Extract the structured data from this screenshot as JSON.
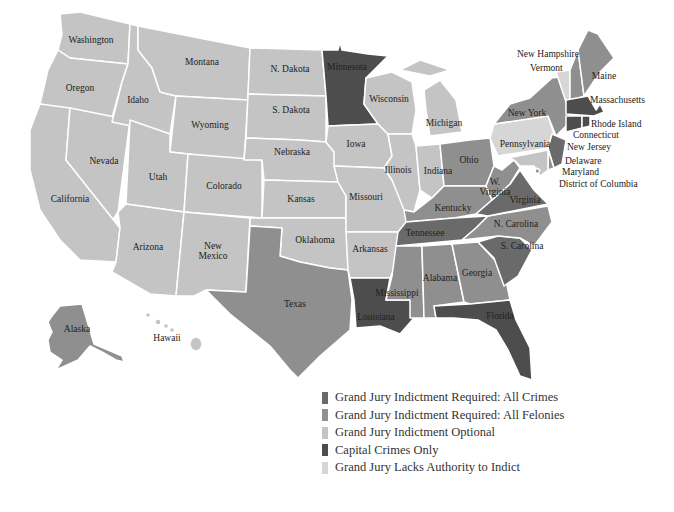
{
  "colors": {
    "all_crimes": "#6a6a6a",
    "all_felonies": "#8f8f8f",
    "optional": "#c4c4c4",
    "capital_only": "#4d4d4d",
    "lacks_authority": "#d6d6d6"
  },
  "legend": {
    "items": [
      {
        "label": "Grand Jury Indictment Required: All Crimes",
        "key": "all_crimes"
      },
      {
        "label": "Grand Jury Indictment Required: All Felonies",
        "key": "all_felonies"
      },
      {
        "label": "Grand Jury Indictment Optional",
        "key": "optional"
      },
      {
        "label": "Capital Crimes Only",
        "key": "capital_only"
      },
      {
        "label": "Grand Jury Lacks Authority to Indict",
        "key": "lacks_authority"
      }
    ]
  },
  "states": {
    "washington": {
      "label": "Washington",
      "category": "optional"
    },
    "oregon": {
      "label": "Oregon",
      "category": "optional"
    },
    "california": {
      "label": "California",
      "category": "optional"
    },
    "nevada": {
      "label": "Nevada",
      "category": "optional"
    },
    "idaho": {
      "label": "Idaho",
      "category": "optional"
    },
    "montana": {
      "label": "Montana",
      "category": "optional"
    },
    "wyoming": {
      "label": "Wyoming",
      "category": "optional"
    },
    "utah": {
      "label": "Utah",
      "category": "optional"
    },
    "colorado": {
      "label": "Colorado",
      "category": "optional"
    },
    "arizona": {
      "label": "Arizona",
      "category": "optional"
    },
    "new_mexico": {
      "label": "New\nMexico",
      "category": "optional"
    },
    "n_dakota": {
      "label": "N. Dakota",
      "category": "optional"
    },
    "s_dakota": {
      "label": "S. Dakota",
      "category": "optional"
    },
    "nebraska": {
      "label": "Nebraska",
      "category": "optional"
    },
    "kansas": {
      "label": "Kansas",
      "category": "optional"
    },
    "oklahoma": {
      "label": "Oklahoma",
      "category": "optional"
    },
    "texas": {
      "label": "Texas",
      "category": "all_felonies"
    },
    "minnesota": {
      "label": "Minnesota",
      "category": "capital_only"
    },
    "iowa": {
      "label": "Iowa",
      "category": "optional"
    },
    "missouri": {
      "label": "Missouri",
      "category": "optional"
    },
    "arkansas": {
      "label": "Arkansas",
      "category": "optional"
    },
    "louisiana": {
      "label": "Louisiana",
      "category": "capital_only"
    },
    "wisconsin": {
      "label": "Wisconsin",
      "category": "optional"
    },
    "illinois": {
      "label": "Illinois",
      "category": "optional"
    },
    "michigan": {
      "label": "Michigan",
      "category": "optional"
    },
    "indiana": {
      "label": "Indiana",
      "category": "optional"
    },
    "ohio": {
      "label": "Ohio",
      "category": "all_felonies"
    },
    "kentucky": {
      "label": "Kentucky",
      "category": "all_felonies"
    },
    "tennessee": {
      "label": "Tennessee",
      "category": "all_crimes"
    },
    "mississippi": {
      "label": "Mississippi",
      "category": "all_felonies"
    },
    "alabama": {
      "label": "Alabama",
      "category": "all_felonies"
    },
    "georgia": {
      "label": "Georgia",
      "category": "all_felonies"
    },
    "florida": {
      "label": "Florida",
      "category": "capital_only"
    },
    "s_carolina": {
      "label": "S. Carolina",
      "category": "all_crimes"
    },
    "n_carolina": {
      "label": "N. Carolina",
      "category": "all_felonies"
    },
    "virginia": {
      "label": "Virginia",
      "category": "all_crimes"
    },
    "w_virginia": {
      "label": "W.\nVirginia",
      "category": "all_felonies"
    },
    "pennsylvania": {
      "label": "Pennsylvania",
      "category": "lacks_authority"
    },
    "new_york": {
      "label": "New York",
      "category": "all_felonies"
    },
    "new_jersey": {
      "label": "New Jersey",
      "category": "all_crimes"
    },
    "delaware": {
      "label": "Delaware",
      "category": "all_felonies"
    },
    "maryland": {
      "label": "Maryland",
      "category": "optional"
    },
    "district_of_columbia": {
      "label": "District of Columbia",
      "category": "all_felonies"
    },
    "connecticut": {
      "label": "Connecticut",
      "category": "capital_only"
    },
    "rhode_island": {
      "label": "Rhode Island",
      "category": "capital_only"
    },
    "massachusetts": {
      "label": "Massachusetts",
      "category": "capital_only"
    },
    "vermont": {
      "label": "Vermont",
      "category": "lacks_authority"
    },
    "new_hampshire": {
      "label": "New Hampshire",
      "category": "all_felonies"
    },
    "maine": {
      "label": "Maine",
      "category": "all_felonies"
    },
    "alaska": {
      "label": "Alaska",
      "category": "all_felonies"
    },
    "hawaii": {
      "label": "Hawaii",
      "category": "optional"
    }
  }
}
